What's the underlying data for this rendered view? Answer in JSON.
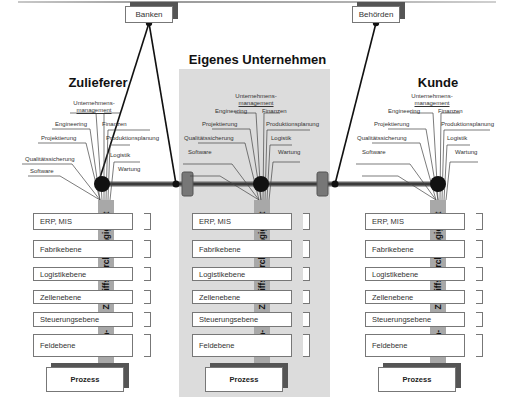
{
  "diagram": {
    "external": [
      {
        "label": "Banken",
        "x": 126,
        "y": 5
      },
      {
        "label": "Behörden",
        "x": 353,
        "y": 5
      }
    ],
    "columns": [
      {
        "title": "Zulieferer",
        "functions": {
          "top": [
            "Unternehmens-",
            "management"
          ],
          "left": [
            "Engineering",
            "Projektierung",
            "Qualitätssicherung",
            "Software"
          ],
          "right": [
            "Finanzen",
            "Produktionsplanung",
            "Logistik",
            "Wartung"
          ]
        },
        "levels": [
          "ERP, MIS",
          "Fabrikebene",
          "Logistikebene",
          "Zellenebene",
          "Steuerungsebene",
          "Feldebene"
        ],
        "access_bar": "Daten- und Zugriffsdurchgängigkeit",
        "process": "Prozess"
      },
      {
        "title": "Eigenes Unternehmen",
        "functions": {
          "top": [
            "Unternehmens-",
            "management"
          ],
          "left": [
            "Engineering",
            "Projektierung",
            "Qualitätssicherung",
            "Software"
          ],
          "right": [
            "Finanzen",
            "Produktionsplanung",
            "Logistik",
            "Wartung"
          ]
        },
        "levels": [
          "ERP, MIS",
          "Fabrikebene",
          "Logistikebene",
          "Zellenebene",
          "Steuerungsebene",
          "Feldebene"
        ],
        "access_bar": "Daten- und Zugriffsdurchgängigkeit",
        "process": "Prozess"
      },
      {
        "title": "Kunde",
        "functions": {
          "top": [
            "Unternehmens-",
            "management"
          ],
          "left": [
            "Engineering",
            "Projektierung",
            "Qualitätssicherung",
            "Software"
          ],
          "right": [
            "Finanzen",
            "Produktionsplanung",
            "Logistik",
            "Wartung"
          ]
        },
        "levels": [
          "ERP, MIS",
          "Fabrikebene",
          "Logistikebene",
          "Zellenebene",
          "Steuerungsebene",
          "Feldebene"
        ],
        "access_bar": "Daten- und Zugriffsdurchgängigkeit",
        "process": "Prozess"
      }
    ],
    "colors": {
      "own_company_bg": "#dcdcdc",
      "access_bar": "#a8a8a8",
      "shadow": "#555555",
      "node": "#111111"
    }
  }
}
